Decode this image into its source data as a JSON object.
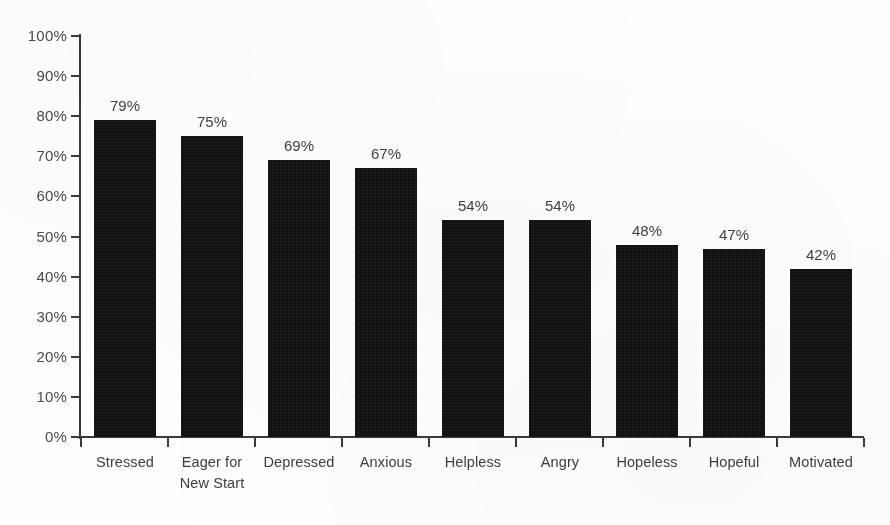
{
  "chart_data": {
    "type": "bar",
    "title": "",
    "subtitle": "",
    "xlabel": "",
    "ylabel": "",
    "ylim": [
      0,
      100
    ],
    "grid": false,
    "legend": "none",
    "orientation": "vertical",
    "bar_color": "#111111",
    "background_color": "#ffffff",
    "axis_color": "#3a3a3a",
    "text_color": "#3f3f3f",
    "categories": [
      "Stressed",
      "Eager for\nNew Start",
      "Depressed",
      "Anxious",
      "Helpless",
      "Angry",
      "Hopeless",
      "Hopeful",
      "Motivated"
    ],
    "values": [
      79,
      75,
      69,
      67,
      54,
      54,
      48,
      47,
      42
    ],
    "value_labels": [
      "79%",
      "75%",
      "69%",
      "67%",
      "54%",
      "54%",
      "48%",
      "47%",
      "42%"
    ],
    "y_ticks": [
      0,
      10,
      20,
      30,
      40,
      50,
      60,
      70,
      80,
      90,
      100
    ],
    "y_tick_labels": [
      "0%",
      "10%",
      "20%",
      "30%",
      "40%",
      "50%",
      "60%",
      "70%",
      "80%",
      "90%",
      "100%"
    ]
  }
}
